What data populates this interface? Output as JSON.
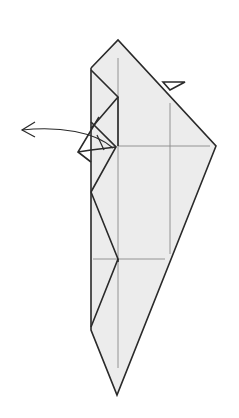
{
  "diagram": {
    "colors": {
      "paper": "#ececec",
      "edge": "#2a2a2a",
      "crease": "#8a8a8a",
      "background": "#ffffff"
    },
    "elements": [
      {
        "id": "main-body",
        "type": "folded paper model"
      },
      {
        "id": "small-flap",
        "type": "flap at upper right edge"
      },
      {
        "id": "left-flap",
        "type": "layered flap at left side"
      },
      {
        "id": "unfold-arrow",
        "type": "curved arrow pointing left",
        "meaning": "swing flap out to the left"
      }
    ]
  }
}
